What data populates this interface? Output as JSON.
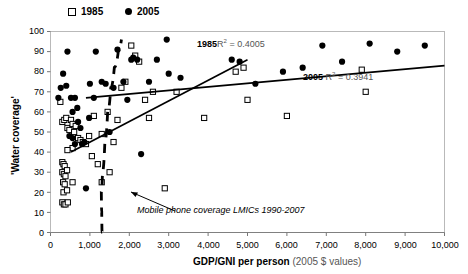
{
  "chart_data": {
    "type": "scatter",
    "title": "",
    "xlabel": "GDP/GNI per person",
    "xlabel_suffix": "(2005 $ values)",
    "ylabel": "'Water coverage'",
    "xlim": [
      0,
      10000
    ],
    "ylim": [
      0,
      100
    ],
    "xticks": [
      "0",
      "1,000",
      "2,000",
      "3,000",
      "4,000",
      "5,000",
      "6,000",
      "7,000",
      "8,000",
      "9,000",
      "10,000"
    ],
    "xtick_values": [
      0,
      1000,
      2000,
      3000,
      4000,
      5000,
      6000,
      7000,
      8000,
      9000,
      10000
    ],
    "yticks": [
      "0",
      "10",
      "20",
      "30",
      "40",
      "50",
      "60",
      "70",
      "80",
      "90",
      "100"
    ],
    "ytick_values": [
      0,
      10,
      20,
      30,
      40,
      50,
      60,
      70,
      80,
      90,
      100
    ],
    "grid": false,
    "legend_position": "top-left",
    "legend": [
      {
        "label": "1985",
        "marker": "open-square"
      },
      {
        "label": "2005",
        "marker": "filled-circle"
      }
    ],
    "series": [
      {
        "name": "1985",
        "marker": "open-square",
        "color": "#000000",
        "points": [
          [
            250,
            65
          ],
          [
            300,
            55
          ],
          [
            350,
            56
          ],
          [
            400,
            57
          ],
          [
            430,
            52
          ],
          [
            480,
            51
          ],
          [
            520,
            56
          ],
          [
            560,
            54
          ],
          [
            600,
            50
          ],
          [
            640,
            53
          ],
          [
            700,
            47
          ],
          [
            760,
            46
          ],
          [
            820,
            45
          ],
          [
            560,
            42
          ],
          [
            430,
            41
          ],
          [
            300,
            35
          ],
          [
            330,
            34
          ],
          [
            360,
            33
          ],
          [
            300,
            30
          ],
          [
            340,
            29
          ],
          [
            380,
            28
          ],
          [
            420,
            31
          ],
          [
            320,
            25
          ],
          [
            360,
            24
          ],
          [
            560,
            25
          ],
          [
            330,
            20
          ],
          [
            420,
            21
          ],
          [
            300,
            15
          ],
          [
            340,
            14
          ],
          [
            380,
            14
          ],
          [
            440,
            15
          ],
          [
            900,
            44
          ],
          [
            980,
            48
          ],
          [
            1050,
            38
          ],
          [
            1100,
            58
          ],
          [
            1200,
            34
          ],
          [
            1300,
            49
          ],
          [
            1450,
            60
          ],
          [
            1500,
            30
          ],
          [
            1600,
            45
          ],
          [
            1700,
            56
          ],
          [
            1800,
            72
          ],
          [
            1900,
            75
          ],
          [
            2050,
            93
          ],
          [
            2150,
            88
          ],
          [
            2250,
            85
          ],
          [
            2400,
            66
          ],
          [
            2500,
            57
          ],
          [
            2600,
            70
          ],
          [
            2900,
            22
          ],
          [
            3200,
            70
          ],
          [
            3900,
            57
          ],
          [
            4700,
            80
          ],
          [
            4900,
            82
          ],
          [
            5000,
            66
          ],
          [
            6000,
            58
          ],
          [
            7900,
            81
          ],
          [
            8000,
            70
          ],
          [
            1300,
            25
          ]
        ]
      },
      {
        "name": "2005",
        "marker": "filled-circle",
        "color": "#000000",
        "points": [
          [
            200,
            67
          ],
          [
            260,
            72
          ],
          [
            320,
            79
          ],
          [
            400,
            73
          ],
          [
            430,
            90
          ],
          [
            520,
            67
          ],
          [
            560,
            60
          ],
          [
            620,
            67
          ],
          [
            680,
            62
          ],
          [
            700,
            55
          ],
          [
            760,
            52
          ],
          [
            800,
            44
          ],
          [
            860,
            45
          ],
          [
            900,
            22
          ],
          [
            620,
            44
          ],
          [
            480,
            48
          ],
          [
            560,
            47
          ],
          [
            1000,
            74
          ],
          [
            1100,
            67
          ],
          [
            1150,
            90
          ],
          [
            1300,
            75
          ],
          [
            1400,
            74
          ],
          [
            1500,
            50
          ],
          [
            1600,
            72
          ],
          [
            1700,
            91
          ],
          [
            1850,
            75
          ],
          [
            1950,
            66
          ],
          [
            2050,
            86
          ],
          [
            2100,
            87
          ],
          [
            2200,
            86
          ],
          [
            2300,
            39
          ],
          [
            2500,
            75
          ],
          [
            2700,
            86
          ],
          [
            3000,
            79
          ],
          [
            3300,
            77
          ],
          [
            4600,
            86
          ],
          [
            4800,
            85
          ],
          [
            5200,
            74
          ],
          [
            5900,
            80
          ],
          [
            6400,
            82
          ],
          [
            6900,
            93
          ],
          [
            7400,
            85
          ],
          [
            8100,
            94
          ],
          [
            8800,
            90
          ],
          [
            9500,
            93
          ],
          [
            2950,
            96
          ],
          [
            980,
            57
          ]
        ]
      }
    ],
    "trendlines": [
      {
        "name": "1985",
        "label": "1985",
        "r2_prefix": "R",
        "r2_sup": "2",
        "r2_text": "= 0.4005",
        "r2_value": 0.4005,
        "x_from": 520,
        "y_from": 40,
        "x_to": 5000,
        "y_to": 86
      },
      {
        "name": "2005",
        "label": "2005",
        "r2_prefix": "R",
        "r2_sup": "2",
        "r2_text": "= 0.3941",
        "r2_value": 0.3941,
        "x_from": 900,
        "y_from": 67,
        "x_to": 10000,
        "y_to": 83
      }
    ],
    "annotations": [
      {
        "name": "mobile-phone-curve-note",
        "text": "Mobile phone coverage LMICs 1990-2007",
        "style": "italic",
        "x": 1500,
        "y": 12
      }
    ],
    "dashed_curve": {
      "name": "mobile-phone-coverage",
      "style": "dashed",
      "points": [
        [
          1310,
          0
        ],
        [
          1300,
          10
        ],
        [
          1290,
          20
        ],
        [
          1320,
          30
        ],
        [
          1380,
          45
        ],
        [
          1450,
          60
        ],
        [
          1530,
          72
        ],
        [
          1620,
          82
        ],
        [
          1720,
          90
        ],
        [
          1800,
          96
        ]
      ]
    }
  },
  "meta": {
    "y_axis_label": "'Water coverage'",
    "x_axis_label_main": "GDP/GNI per person",
    "x_axis_label_sub": "(2005 $ values)"
  }
}
